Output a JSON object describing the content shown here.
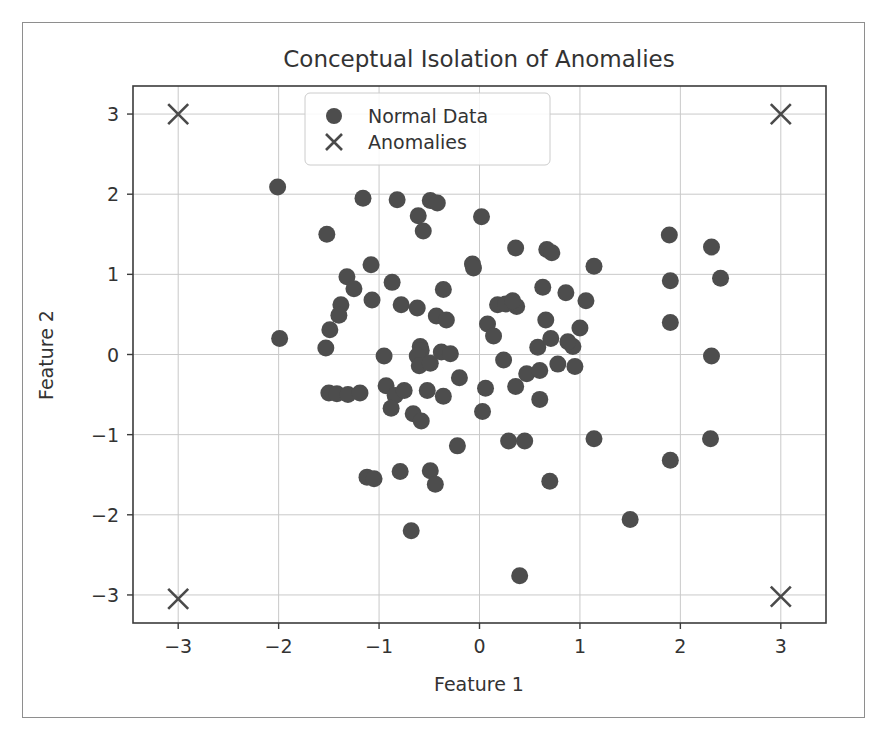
{
  "chart_data": {
    "type": "scatter",
    "title": "Conceptual Isolation of Anomalies",
    "xlabel": "Feature 1",
    "ylabel": "Feature 2",
    "xlim": [
      -3.45,
      3.45
    ],
    "ylim": [
      -3.35,
      3.35
    ],
    "xticks": [
      -3,
      -2,
      -1,
      0,
      1,
      2,
      3
    ],
    "xticklabels": [
      "−3",
      "−2",
      "−1",
      "0",
      "1",
      "2",
      "3"
    ],
    "yticks": [
      -3,
      -2,
      -1,
      0,
      1,
      2,
      3
    ],
    "yticklabels": [
      "−3",
      "−2",
      "−1",
      "0",
      "1",
      "2",
      "3"
    ],
    "grid": true,
    "legend_position": "upper center",
    "marker_color": "#4d4d4d",
    "anomaly_color": "#4a4a4a",
    "grid_color": "#c9c9c9",
    "series": [
      {
        "name": "Normal Data",
        "marker": "circle",
        "color": "#4d4d4d",
        "points": [
          [
            -2.01,
            2.09
          ],
          [
            -1.16,
            1.95
          ],
          [
            -0.82,
            1.93
          ],
          [
            -0.49,
            1.92
          ],
          [
            -0.42,
            1.89
          ],
          [
            -0.61,
            1.73
          ],
          [
            0.02,
            1.72
          ],
          [
            -0.56,
            1.54
          ],
          [
            -1.52,
            1.5
          ],
          [
            1.89,
            1.49
          ],
          [
            2.31,
            1.34
          ],
          [
            0.36,
            1.33
          ],
          [
            0.67,
            1.31
          ],
          [
            0.72,
            1.27
          ],
          [
            1.14,
            1.1
          ],
          [
            -1.08,
            1.12
          ],
          [
            -1.32,
            0.97
          ],
          [
            -0.07,
            1.13
          ],
          [
            -0.06,
            1.08
          ],
          [
            1.9,
            0.92
          ],
          [
            2.4,
            0.95
          ],
          [
            -0.87,
            0.9
          ],
          [
            -1.25,
            0.82
          ],
          [
            -0.36,
            0.81
          ],
          [
            -1.38,
            0.62
          ],
          [
            -1.07,
            0.68
          ],
          [
            0.63,
            0.84
          ],
          [
            0.86,
            0.77
          ],
          [
            -0.78,
            0.62
          ],
          [
            -0.62,
            0.58
          ],
          [
            0.18,
            0.62
          ],
          [
            0.26,
            0.63
          ],
          [
            0.37,
            0.6
          ],
          [
            0.33,
            0.67
          ],
          [
            1.06,
            0.67
          ],
          [
            -1.4,
            0.49
          ],
          [
            -1.49,
            0.31
          ],
          [
            -1.53,
            0.08
          ],
          [
            0.66,
            0.43
          ],
          [
            1.9,
            0.4
          ],
          [
            -1.99,
            0.2
          ],
          [
            0.08,
            0.38
          ],
          [
            -0.43,
            0.48
          ],
          [
            -0.33,
            0.43
          ],
          [
            0.14,
            0.23
          ],
          [
            -0.59,
            0.1
          ],
          [
            -0.58,
            0.05
          ],
          [
            -0.62,
            -0.02
          ],
          [
            -0.6,
            -0.14
          ],
          [
            -0.49,
            -0.11
          ],
          [
            -0.38,
            0.03
          ],
          [
            0.58,
            0.09
          ],
          [
            0.71,
            0.2
          ],
          [
            0.93,
            0.1
          ],
          [
            0.88,
            0.16
          ],
          [
            1.0,
            0.33
          ],
          [
            2.31,
            -0.02
          ],
          [
            -0.95,
            -0.02
          ],
          [
            -0.29,
            0.01
          ],
          [
            0.24,
            -0.07
          ],
          [
            0.78,
            -0.12
          ],
          [
            0.95,
            -0.15
          ],
          [
            0.47,
            -0.24
          ],
          [
            0.6,
            -0.2
          ],
          [
            -0.2,
            -0.29
          ],
          [
            -1.5,
            -0.48
          ],
          [
            -1.42,
            -0.49
          ],
          [
            -1.31,
            -0.5
          ],
          [
            -1.19,
            -0.48
          ],
          [
            -0.93,
            -0.39
          ],
          [
            -0.84,
            -0.51
          ],
          [
            -0.75,
            -0.45
          ],
          [
            -0.52,
            -0.45
          ],
          [
            -0.36,
            -0.52
          ],
          [
            0.06,
            -0.42
          ],
          [
            0.36,
            -0.4
          ],
          [
            0.6,
            -0.56
          ],
          [
            -0.88,
            -0.67
          ],
          [
            -0.66,
            -0.74
          ],
          [
            0.03,
            -0.71
          ],
          [
            -0.58,
            -0.83
          ],
          [
            -0.22,
            -1.14
          ],
          [
            0.29,
            -1.08
          ],
          [
            0.45,
            -1.08
          ],
          [
            1.14,
            -1.05
          ],
          [
            2.3,
            -1.05
          ],
          [
            1.9,
            -1.32
          ],
          [
            -1.12,
            -1.53
          ],
          [
            -1.05,
            -1.55
          ],
          [
            -0.79,
            -1.46
          ],
          [
            -0.49,
            -1.45
          ],
          [
            -0.44,
            -1.62
          ],
          [
            0.7,
            -1.58
          ],
          [
            -0.68,
            -2.2
          ],
          [
            1.5,
            -2.06
          ],
          [
            0.4,
            -2.76
          ]
        ]
      },
      {
        "name": "Anomalies",
        "marker": "x",
        "color": "#4a4a4a",
        "points": [
          [
            -3,
            3
          ],
          [
            3,
            3
          ],
          [
            -3,
            -3.05
          ],
          [
            3,
            -3.02
          ]
        ]
      }
    ]
  },
  "legend": {
    "entries": [
      {
        "label": "Normal Data",
        "marker": "circle"
      },
      {
        "label": "Anomalies",
        "marker": "x"
      }
    ]
  }
}
